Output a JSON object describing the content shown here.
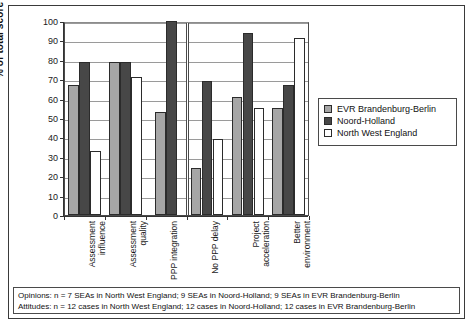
{
  "chart_data": {
    "type": "bar",
    "title": "",
    "xlabel": "",
    "ylabel": "% of total score",
    "ylim": [
      0,
      100
    ],
    "ytick_step": 10,
    "yticks": [
      0,
      10,
      20,
      30,
      40,
      50,
      60,
      70,
      80,
      90,
      100
    ],
    "grid": true,
    "legend_position": "right",
    "categories": [
      "Assessment\ninfluence",
      "Assessment\nquality",
      "PPP integration",
      "No PPP delay",
      "Project\nacceleration",
      "Better\nenvironment"
    ],
    "series": [
      {
        "name": "EVR Brandenburg-Berlin",
        "color": "#a6a6a6",
        "values": [
          67,
          79,
          53,
          24,
          61,
          55
        ]
      },
      {
        "name": "Noord-Holland",
        "color": "#474747",
        "values": [
          79,
          79,
          100,
          69,
          94,
          67
        ]
      },
      {
        "name": "North West England",
        "color": "#ffffff",
        "values": [
          33,
          71,
          null,
          39,
          55,
          91
        ]
      }
    ],
    "group_divider_after_category": 3,
    "notes": [
      "Opinions: n = 7 SEAs in North West England; 9 SEAs in Noord-Holland; 9 SEAs in EVR Brandenburg-Berlin",
      "Attitudes: n = 12 cases in North West England; 12 cases in Noord-Holland; 12 cases in EVR Brandenburg-Berlin"
    ]
  },
  "legend": {
    "items": [
      {
        "label": "EVR Brandenburg-Berlin",
        "swatch": "series-evr"
      },
      {
        "label": "Noord-Holland",
        "swatch": "series-noord"
      },
      {
        "label": "North West England",
        "swatch": "series-nwe"
      }
    ]
  },
  "footnote": {
    "line1": "Opinions: n = 7 SEAs in North West England; 9 SEAs in Noord-Holland; 9 SEAs in EVR Brandenburg-Berlin",
    "line2": "Attitudes: n = 12 cases in North West England; 12 cases in Noord-Holland; 12 cases in EVR Brandenburg-Berlin"
  },
  "axis": {
    "y_title": "% of total score"
  }
}
